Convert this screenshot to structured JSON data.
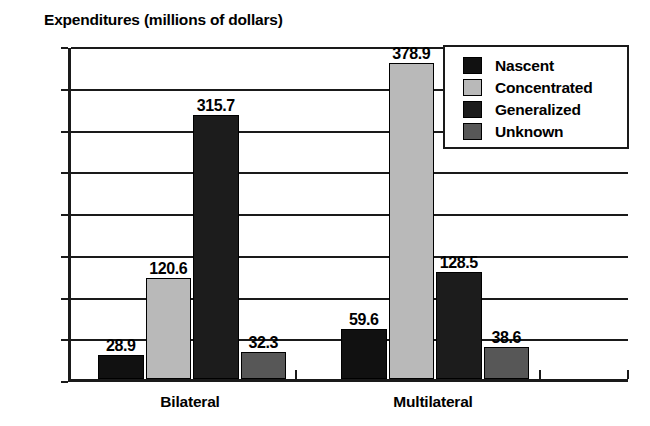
{
  "chart_data": {
    "type": "bar",
    "title": "Expenditures (millions of dollars)",
    "xlabel": "",
    "ylabel": "",
    "ylim": [
      0,
      400
    ],
    "yticks": [
      0,
      50,
      100,
      150,
      200,
      250,
      300,
      350,
      400
    ],
    "grid": true,
    "legend_position": "top-right",
    "categories": [
      "Bilateral",
      "Multilateral"
    ],
    "series": [
      {
        "name": "Nascent",
        "color": "#111111",
        "values": [
          28.9,
          59.6
        ]
      },
      {
        "name": "Concentrated",
        "color": "#b9b9b9",
        "values": [
          120.6,
          378.9
        ]
      },
      {
        "name": "Generalized",
        "color": "#1c1c1c",
        "values": [
          315.7,
          128.5
        ]
      },
      {
        "name": "Unknown",
        "color": "#575757",
        "values": [
          32.3,
          38.6
        ]
      }
    ],
    "data_labels": [
      [
        "28.9",
        "120.6",
        "315.7",
        "32.3"
      ],
      [
        "59.6",
        "378.9",
        "128.5",
        "38.6"
      ]
    ]
  },
  "legend": {
    "items": [
      {
        "label": "Nascent"
      },
      {
        "label": "Concentrated"
      },
      {
        "label": "Generalized"
      },
      {
        "label": "Unknown"
      }
    ]
  }
}
